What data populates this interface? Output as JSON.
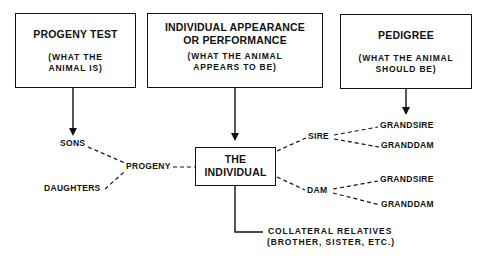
{
  "boxes": {
    "progeny_test": {
      "title": "PROGENY TEST",
      "subtitle_1": "(WHAT THE",
      "subtitle_2": "ANIMAL IS)"
    },
    "individual_appearance": {
      "title_1": "INDIVIDUAL APPEARANCE",
      "title_2": "OR PERFORMANCE",
      "subtitle_1": "(WHAT THE ANIMAL",
      "subtitle_2": "APPEARS TO BE)"
    },
    "pedigree": {
      "title": "PEDIGREE",
      "subtitle_1": "(WHAT THE ANIMAL",
      "subtitle_2": "SHOULD BE)"
    },
    "the_individual": {
      "title_1": "THE",
      "title_2": "INDIVIDUAL"
    }
  },
  "labels": {
    "sons": "SONS",
    "daughters": "DAUGHTERS",
    "progeny": "PROGENY",
    "sire": "SIRE",
    "dam": "DAM",
    "sire_grandsire": "GRANDSIRE",
    "sire_granddam": "GRANDDAM",
    "dam_grandsire": "GRANDSIRE",
    "dam_granddam": "GRANDDAM",
    "collateral_1": "COLLATERAL RELATIVES",
    "collateral_2": "(BROTHER, SISTER, ETC.)"
  },
  "colors": {
    "ink": "#111111",
    "background": "#ffffff"
  }
}
